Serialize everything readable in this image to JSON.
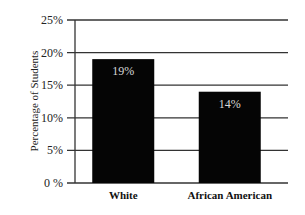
{
  "chart_data": {
    "type": "bar",
    "title": "",
    "xlabel": "",
    "ylabel": "Percentage of Students",
    "categories": [
      "White",
      "African American"
    ],
    "values": [
      19,
      14
    ],
    "data_labels": [
      "19%",
      "14%"
    ],
    "ylim": [
      0,
      25
    ],
    "yticks": [
      0,
      5,
      10,
      15,
      20,
      25
    ],
    "ytick_labels": [
      "0 %",
      "5%",
      "10%",
      "15%",
      "20%",
      "25%"
    ],
    "grid": true,
    "legend": "none",
    "colors": {
      "bar": "#050505",
      "bar_label": "#d8d8d8",
      "grid": "#333333"
    }
  }
}
